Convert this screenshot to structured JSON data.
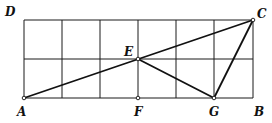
{
  "diagram": {
    "type": "geometry-grid",
    "grid": {
      "columns": 6,
      "rows": 2,
      "x0": 24,
      "y0": 20,
      "cell_w": 38.17,
      "cell_h": 39,
      "stroke": "#1a1a1a"
    },
    "points": [
      {
        "name": "D",
        "label": "D",
        "x": 24,
        "y": 20,
        "lx": 5,
        "ly": 16
      },
      {
        "name": "C",
        "label": "C",
        "x": 253,
        "y": 20,
        "lx": 257,
        "ly": 18
      },
      {
        "name": "E",
        "label": "E",
        "x": 138,
        "y": 59,
        "lx": 124,
        "ly": 56
      },
      {
        "name": "A",
        "label": "A",
        "x": 24,
        "y": 98,
        "lx": 17,
        "ly": 116
      },
      {
        "name": "F",
        "label": "F",
        "x": 138,
        "y": 98,
        "lx": 134,
        "ly": 116
      },
      {
        "name": "G",
        "label": "G",
        "x": 214,
        "y": 98,
        "lx": 209,
        "ly": 116
      },
      {
        "name": "B",
        "label": "B",
        "x": 253,
        "y": 98,
        "lx": 254,
        "ly": 116
      }
    ],
    "segments": [
      {
        "from": "A",
        "to": "C"
      },
      {
        "from": "E",
        "to": "G"
      },
      {
        "from": "G",
        "to": "C"
      }
    ],
    "marked_points": [
      "A",
      "E",
      "F",
      "G",
      "C"
    ],
    "labels": {
      "D": "D",
      "C": "C",
      "E": "E",
      "A": "A",
      "F": "F",
      "G": "G",
      "B": "B"
    }
  }
}
